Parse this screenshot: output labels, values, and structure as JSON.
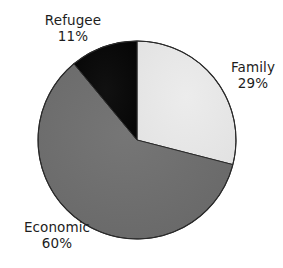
{
  "chart_data": {
    "type": "pie",
    "title": "",
    "subtitle": "",
    "xlabel": "",
    "ylabel": "",
    "grid": false,
    "legend": "none",
    "label_position": "outside",
    "start_angle_deg": 0,
    "direction": "clockwise",
    "categories": [
      "Family",
      "Economic",
      "Refugee"
    ],
    "values": [
      29,
      60,
      11
    ],
    "value_unit": "%",
    "slices": [
      {
        "name": "Family",
        "value": 29,
        "label": "Family",
        "value_label": "29%",
        "color": "#e8e8e8",
        "start_deg": 0,
        "end_deg": 104.4
      },
      {
        "name": "Economic",
        "value": 60,
        "label": "Economic",
        "value_label": "60%",
        "color": "#6e6e6e",
        "start_deg": 104.4,
        "end_deg": 320.4
      },
      {
        "name": "Refugee",
        "value": 11,
        "label": "Refugee",
        "value_label": "11%",
        "color": "#0a0a0a",
        "start_deg": 320.4,
        "end_deg": 360
      }
    ]
  },
  "geometry": {
    "center_x": 137,
    "center_y": 140,
    "radius": 99,
    "outline_color": "#2a2a2a",
    "outline_width": 1
  },
  "colors": {
    "background": "#ffffff",
    "text": "#1d1d1d",
    "family_slice": "#e8e8e8",
    "economic_slice": "#6e6e6e",
    "refugee_slice": "#0a0a0a"
  }
}
